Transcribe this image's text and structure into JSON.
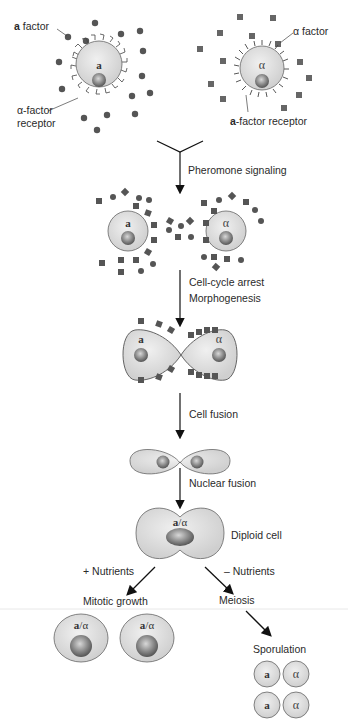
{
  "labels": {
    "a_factor_bold": "a",
    "a_factor_rest": " factor",
    "alpha_factor": "α factor",
    "alpha_receptor_1": "α-factor",
    "alpha_receptor_2": "receptor",
    "a_receptor_bold": "a",
    "a_receptor_rest": "-factor receptor",
    "pheromone": "Pheromone signaling",
    "arrest": "Cell-cycle arrest",
    "morpho": "Morphogenesis",
    "fusion": "Cell fusion",
    "nuclear": "Nuclear fusion",
    "diploid": "Diploid cell",
    "plus_nutrients": "+ Nutrients",
    "minus_nutrients": "– Nutrients",
    "mitotic": "Mitotic growth",
    "meiosis": "Meiosis",
    "sporulation": "Sporulation"
  },
  "cells": {
    "a": "a",
    "alpha": "α",
    "diploid_a": "a",
    "diploid_sep": "/α",
    "spore_a": "a",
    "spore_alpha": "α"
  },
  "colors": {
    "cell_fill": "#dcdcdc",
    "cell_stroke": "#555555",
    "nucleus": "#7a7a7a",
    "a_factor_dot": "#555555",
    "alpha_factor_square": "#666666",
    "arrow": "#111111"
  }
}
